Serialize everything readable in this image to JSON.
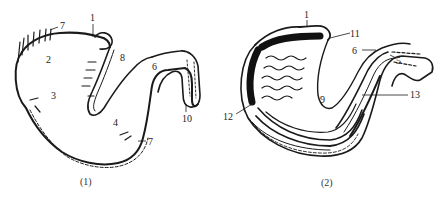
{
  "figure": {
    "panels": [
      {
        "id": "panel-1",
        "caption": "(1)",
        "view": "external view",
        "labels": [
          "7",
          "1",
          "8",
          "2",
          "3",
          "6",
          "4",
          "10",
          "7"
        ]
      },
      {
        "id": "panel-2",
        "caption": "(2)",
        "view": "internal view with mucosal folds",
        "labels": [
          "1",
          "11",
          "6",
          "5",
          "9",
          "13",
          "12"
        ]
      }
    ]
  },
  "colors": {
    "ink": "#1a1a1a",
    "background": "#ffffff"
  }
}
